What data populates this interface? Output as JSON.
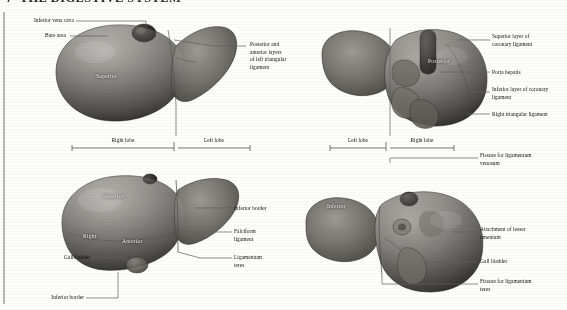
{
  "heading": {
    "number": "7",
    "title": "THE DIGESTIVE SYSTEM"
  },
  "panels": [
    {
      "id": "superior-view",
      "name": "Superior view of liver",
      "organ_labels": [
        {
          "text": "Superior"
        }
      ],
      "labels_left": [
        {
          "text": "Inferior vena cava"
        },
        {
          "text": "Bare area"
        }
      ],
      "labels_right": [
        {
          "text": "Posterior and"
        },
        {
          "text": "anterior layers"
        },
        {
          "text": "of left triangular"
        },
        {
          "text": "ligament"
        }
      ],
      "brackets": [
        {
          "text": "Right lobe"
        },
        {
          "text": "Left lobe"
        }
      ]
    },
    {
      "id": "posterior-view",
      "name": "Posterior view of liver",
      "organ_labels": [
        {
          "text": "Posterior"
        }
      ],
      "labels_right": [
        {
          "text": "Superior layer of"
        },
        {
          "text": "coronary ligament"
        },
        {
          "text": "Porta hepatis"
        },
        {
          "text": "Inferior layer of coronary"
        },
        {
          "text": "ligament"
        },
        {
          "text": "Right triangular ligament"
        }
      ],
      "brackets": [
        {
          "text": "Left lobe"
        },
        {
          "text": "Right lobe"
        }
      ]
    },
    {
      "id": "anterior-view",
      "name": "Anterior view of liver",
      "organ_labels": [
        {
          "text": "Superior"
        },
        {
          "text": "Right"
        },
        {
          "text": "Anterior"
        }
      ],
      "labels_left": [
        {
          "text": "Gallbladder"
        },
        {
          "text": "Inferior border"
        }
      ],
      "labels_right": [
        {
          "text": "Inferior border"
        },
        {
          "text": "Falciform"
        },
        {
          "text": "ligament"
        },
        {
          "text": "Ligamentum"
        },
        {
          "text": "teres"
        }
      ]
    },
    {
      "id": "inferior-view",
      "name": "Inferior view of liver",
      "organ_labels": [
        {
          "text": "Inferior"
        }
      ],
      "labels_right": [
        {
          "text": "Fissure for ligamentum"
        },
        {
          "text": "venosum"
        },
        {
          "text": "Attachment of lesser"
        },
        {
          "text": "omentum"
        },
        {
          "text": "Gall bladder"
        },
        {
          "text": "Fissure for ligamentum"
        },
        {
          "text": "teres"
        }
      ]
    }
  ],
  "text": {
    "inferior_vena_cava": "Inferior vena cava",
    "bare_area": "Bare area",
    "post_ant_1": "Posterior and",
    "post_ant_2": "anterior layers",
    "post_ant_3": "of left triangular",
    "post_ant_4": "ligament",
    "superior_region": "Superior",
    "right_lobe": "Right lobe",
    "left_lobe": "Left lobe",
    "posterior_region": "Posterior",
    "sup_layer_1": "Superior layer of",
    "sup_layer_2": "coronary ligament",
    "porta_hepatis": "Porta hepatis",
    "inf_layer_1": "Inferior layer of coronary",
    "inf_layer_2": "ligament",
    "right_triangular": "Right triangular ligament",
    "left_lobe2": "Left lobe",
    "right_lobe2": "Right lobe",
    "fissure_venosum_1": "Fissure for ligamentum",
    "fissure_venosum_2": "venosum",
    "superior_region2": "Superior",
    "right_region": "Right",
    "anterior_region": "Anterior",
    "gallbladder": "Gallbladder",
    "inferior_border_bl": "Inferior border",
    "inferior_border_r": "Inferior border",
    "falciform_1": "Falciform",
    "falciform_2": "ligament",
    "ligamentum_teres_1": "Ligamentum",
    "ligamentum_teres_2": "teres",
    "inferior_region": "Inferior",
    "attachment_1": "Attachment of lesser",
    "attachment_2": "omentum",
    "gall_bladder": "Gall bladder",
    "fissure_teres_1": "Fissure for ligamentum",
    "fissure_teres_2": "teres"
  },
  "colors": {
    "page": "#fdfdfb",
    "ink": "#121214",
    "leader": "#5e5e62",
    "rule": "#b9b9b4",
    "organ_light": "#8e8c88",
    "organ_mid": "#6d6b67",
    "organ_dark": "#46443f"
  }
}
